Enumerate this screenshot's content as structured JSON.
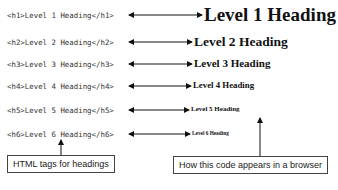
{
  "rows": [
    {
      "code": "<h1>Level 1 Heading</h1>",
      "rendered": "Level 1 Heading"
    },
    {
      "code": "<h2>Level 2 Heading</h2>",
      "rendered": "Level 2 Heading"
    },
    {
      "code": "<h3>Level 3 Heading</h3>",
      "rendered": "Level 3 Heading"
    },
    {
      "code": "<h4>Level 4 Heading</h4>",
      "rendered": "Level 4 Heading"
    },
    {
      "code": "<h5>Level 5 Heading</h5>",
      "rendered": "Level 5 Heading"
    },
    {
      "code": "<h6>Level 6 Heading</h6>",
      "rendered": "Level 6 Heading"
    }
  ],
  "callouts": {
    "left": "HTML tags for headings",
    "right": "How this code appears in a browser"
  }
}
